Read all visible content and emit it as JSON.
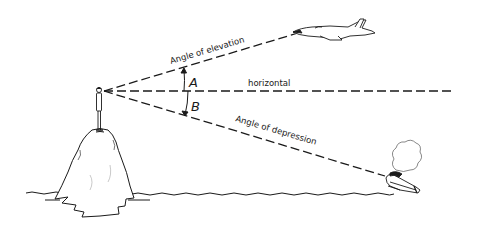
{
  "diagram": {
    "labels": {
      "elevation": "Angle of elevation",
      "horizontal": "horizontal",
      "depression": "Angle of depression",
      "angle_a": "A",
      "angle_b": "B"
    },
    "elements": [
      {
        "name": "observer",
        "description": "person standing on top of rocky island"
      },
      {
        "name": "island",
        "description": "rocky island rising from water"
      },
      {
        "name": "airplane",
        "description": "jet aircraft above the horizontal"
      },
      {
        "name": "boat",
        "description": "boat on water below the horizontal, emitting smoke"
      },
      {
        "name": "water",
        "description": "wavy water line"
      }
    ],
    "colors": {
      "ink": "#1a1a1a",
      "background": "#ffffff"
    }
  }
}
